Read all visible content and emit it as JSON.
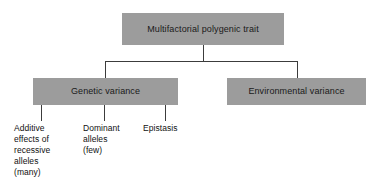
{
  "diagram": {
    "type": "hierarchy-tree",
    "colors": {
      "box_fill": "#9c9c9c",
      "connector": "#3c3c3c",
      "text": "#111111",
      "background": "#ffffff"
    },
    "nodes": {
      "root": {
        "label": "Multifactorial polygenic trait",
        "level": 0
      },
      "genetic": {
        "label": "Genetic variance",
        "level": 1
      },
      "environmental": {
        "label": "Environmental variance",
        "level": 1
      }
    },
    "leaves": [
      {
        "id": "additive",
        "label": "Additive\neffects of\nrecessive\nalleles\n(many)",
        "parent": "genetic"
      },
      {
        "id": "dominant",
        "label": "Dominant\nalleles\n(few)",
        "parent": "genetic"
      },
      {
        "id": "epistasis",
        "label": "Epistasis",
        "parent": "genetic"
      }
    ]
  }
}
